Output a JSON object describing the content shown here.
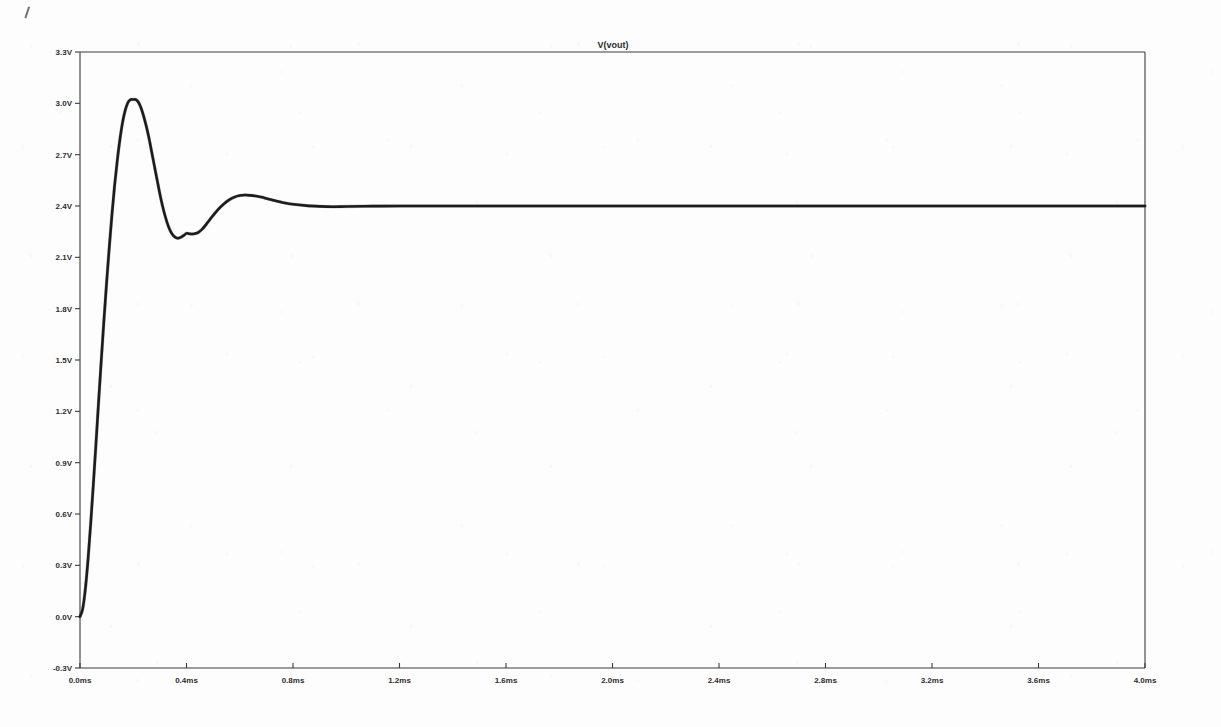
{
  "window": {
    "title": "V(vout)"
  },
  "chart_data": {
    "type": "line",
    "title": "V(vout)",
    "xlabel": "",
    "ylabel": "",
    "xlim": [
      0.0,
      4.0
    ],
    "ylim": [
      -0.3,
      3.3
    ],
    "x_unit": "ms",
    "y_unit": "V",
    "grid": false,
    "legend": "none",
    "x_ticks": [
      "0.0ms",
      "0.4ms",
      "0.8ms",
      "1.2ms",
      "1.6ms",
      "2.0ms",
      "2.4ms",
      "2.8ms",
      "3.2ms",
      "3.6ms",
      "4.0ms"
    ],
    "x_tick_values": [
      0.0,
      0.4,
      0.8,
      1.2,
      1.6,
      2.0,
      2.4,
      2.8,
      3.2,
      3.6,
      4.0
    ],
    "y_ticks": [
      "3.3V",
      "3.0V",
      "2.7V",
      "2.4V",
      "2.1V",
      "1.8V",
      "1.5V",
      "1.2V",
      "0.9V",
      "0.6V",
      "0.3V",
      "0.0V",
      "-0.3V"
    ],
    "y_tick_values": [
      3.3,
      3.0,
      2.7,
      2.4,
      2.1,
      1.8,
      1.5,
      1.2,
      0.9,
      0.6,
      0.3,
      0.0,
      -0.3
    ],
    "series": [
      {
        "name": "V(vout)",
        "color": "#1c1c1c",
        "description": "Damped second-order step response settling to 2.4 V",
        "annotations": {
          "start_value": 0.0,
          "settling_value": 2.4,
          "first_peak_time_ms": 0.21,
          "first_peak_value": 3.02,
          "first_trough_time_ms": 0.44,
          "first_trough_value": 2.24,
          "second_peak_time_ms": 0.67,
          "second_peak_value": 2.46,
          "settled_after_ms": 1.0
        },
        "x": [
          0.0,
          0.01,
          0.02,
          0.03,
          0.04,
          0.05,
          0.06,
          0.07,
          0.08,
          0.09,
          0.1,
          0.11,
          0.12,
          0.13,
          0.14,
          0.15,
          0.16,
          0.17,
          0.18,
          0.19,
          0.2,
          0.21,
          0.22,
          0.23,
          0.24,
          0.25,
          0.26,
          0.27,
          0.28,
          0.29,
          0.3,
          0.31,
          0.32,
          0.33,
          0.34,
          0.35,
          0.36,
          0.37,
          0.38,
          0.39,
          0.4,
          0.41,
          0.42,
          0.43,
          0.44,
          0.45,
          0.46,
          0.47,
          0.48,
          0.49,
          0.5,
          0.52,
          0.54,
          0.56,
          0.58,
          0.6,
          0.62,
          0.64,
          0.66,
          0.68,
          0.7,
          0.72,
          0.74,
          0.76,
          0.78,
          0.8,
          0.85,
          0.9,
          0.95,
          1.0,
          1.1,
          1.2,
          1.4,
          1.6,
          1.8,
          2.0,
          2.2,
          2.4,
          2.6,
          2.8,
          3.0,
          3.2,
          3.4,
          3.6,
          3.8,
          4.0
        ],
        "y": [
          0.0,
          0.045,
          0.16,
          0.33,
          0.54,
          0.77,
          1.01,
          1.26,
          1.5,
          1.735,
          1.955,
          2.16,
          2.35,
          2.52,
          2.665,
          2.79,
          2.89,
          2.96,
          3.005,
          3.022,
          3.022,
          3.022,
          3.005,
          2.97,
          2.92,
          2.86,
          2.79,
          2.71,
          2.63,
          2.55,
          2.47,
          2.4,
          2.34,
          2.29,
          2.252,
          2.228,
          2.215,
          2.212,
          2.218,
          2.228,
          2.24,
          2.238,
          2.236,
          2.238,
          2.242,
          2.252,
          2.266,
          2.285,
          2.305,
          2.325,
          2.345,
          2.382,
          2.412,
          2.436,
          2.452,
          2.461,
          2.464,
          2.462,
          2.458,
          2.452,
          2.444,
          2.436,
          2.428,
          2.421,
          2.415,
          2.41,
          2.402,
          2.398,
          2.396,
          2.397,
          2.399,
          2.4,
          2.4,
          2.4,
          2.4,
          2.4,
          2.4,
          2.4,
          2.4,
          2.4,
          2.4,
          2.4,
          2.4,
          2.4,
          2.4,
          2.4
        ]
      }
    ]
  }
}
